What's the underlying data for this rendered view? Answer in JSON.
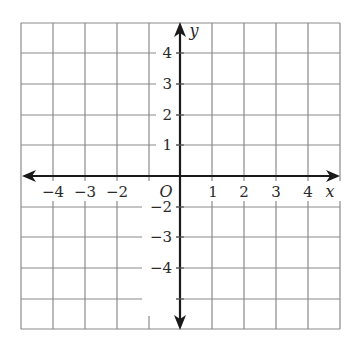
{
  "diagram": {
    "type": "coordinate-plane",
    "x_axis": {
      "label": "x",
      "range": [
        -5,
        5
      ],
      "tick_labels": [
        "−4",
        "−3",
        "−2",
        "1",
        "2",
        "3",
        "4"
      ]
    },
    "y_axis": {
      "label": "y",
      "range": [
        -5,
        5
      ],
      "tick_labels": [
        "4",
        "3",
        "2",
        "1",
        "−2",
        "−3",
        "−4"
      ]
    },
    "origin_label": "O",
    "grid": {
      "columns": 10,
      "rows": 10,
      "unit": 1
    },
    "colors": {
      "grid": "#8a8a8a",
      "axis": "#1a1a1a",
      "text": "#2a2a2a"
    }
  },
  "labels": {
    "x_neg4": "−4",
    "x_neg3": "−3",
    "x_neg2": "−2",
    "x_1": "1",
    "x_2": "2",
    "x_3": "3",
    "x_4": "4",
    "y_4": "4",
    "y_3": "3",
    "y_2": "2",
    "y_1": "1",
    "y_neg2": "−2",
    "y_neg3": "−3",
    "y_neg4": "−4",
    "origin": "O",
    "x_var": "x",
    "y_var": "y"
  }
}
